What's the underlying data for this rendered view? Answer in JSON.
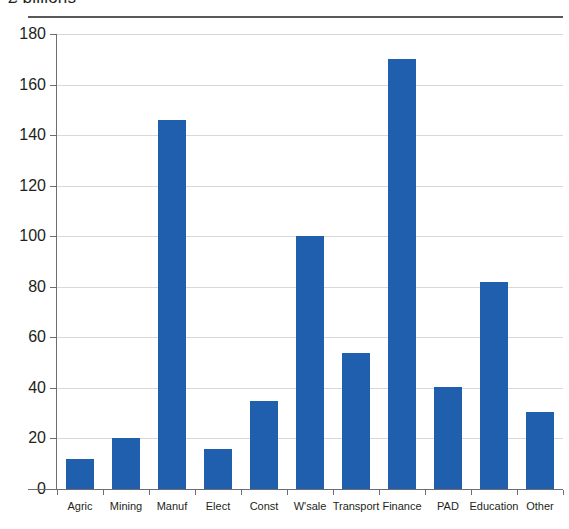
{
  "chart_data": {
    "type": "bar",
    "title": "£ billions",
    "subtitle": "",
    "xlabel": "",
    "ylabel": "",
    "categories": [
      "Agric",
      "Mining",
      "Manuf",
      "Elect",
      "Const",
      "W'sale",
      "Transport",
      "Finance",
      "PAD",
      "Education",
      "Other"
    ],
    "values": [
      12,
      20,
      146,
      16,
      35,
      100,
      54,
      170,
      40.5,
      82,
      30.5
    ],
    "series": [
      {
        "name": "",
        "values": [
          12,
          20,
          146,
          16,
          35,
          100,
          54,
          170,
          40.5,
          82,
          30.5
        ]
      }
    ],
    "ylim": [
      0,
      180
    ],
    "ytick_labels": [
      "0",
      "20",
      "40",
      "60",
      "80",
      "100",
      "120",
      "140",
      "160",
      "180"
    ],
    "ytick_values": [
      0,
      20,
      40,
      60,
      80,
      100,
      120,
      140,
      160,
      180
    ],
    "grid": true,
    "legend": false,
    "legend_position": "none",
    "bar_color": "#1f5fae",
    "gridline_color": "#d7d8da",
    "axis_color": "#6d6e71",
    "text_color": "#231f20",
    "background": "#ffffff"
  }
}
